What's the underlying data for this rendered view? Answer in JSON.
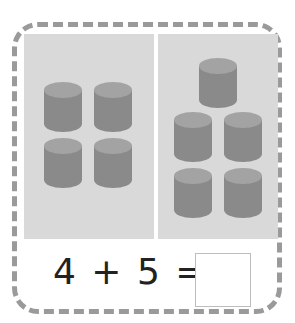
{
  "worksheet": {
    "left_group_count": 4,
    "right_group_count": 5,
    "equation": "4 + 5 =",
    "answer": "",
    "object_icon": "cylinder-icon",
    "colors": {
      "frame_border": "#9a9a9a",
      "panel_bg": "#d9d9d9",
      "cylinder_body": "#8a8a8a",
      "cylinder_top": "#a3a3a3"
    }
  }
}
